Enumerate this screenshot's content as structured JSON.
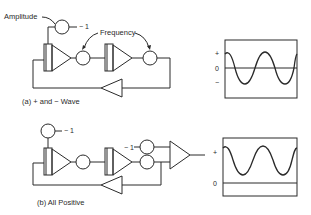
{
  "diagram_a": {
    "caption": "(a) + and − Wave",
    "amplitude_label": "Amplitude",
    "frequency_label": "Frequency",
    "pot_input_label": "− 1",
    "components": [
      "amplitude-potentiometer",
      "integrator-1",
      "frequency-potentiometer-1",
      "integrator-2",
      "frequency-potentiometer-2",
      "inverter"
    ],
    "scope": {
      "plus_label": "+",
      "zero_label": "0",
      "minus_label": "−",
      "waveform": "sine wave centered on zero (positive and negative)"
    }
  },
  "diagram_b": {
    "caption": "(b) All Positive",
    "pot_input_label": "− 1",
    "bias_input_label": "− 1",
    "components": [
      "amplitude-potentiometer",
      "integrator-1",
      "frequency-potentiometer-1",
      "integrator-2",
      "bias-potentiometer",
      "frequency-potentiometer-2",
      "summing-amplifier",
      "inverter"
    ],
    "scope": {
      "plus_label": "+",
      "zero_label": "0",
      "waveform": "sine wave offset entirely above zero"
    }
  },
  "colors": {
    "ink": "#2a2a2a",
    "background": "#ffffff"
  }
}
